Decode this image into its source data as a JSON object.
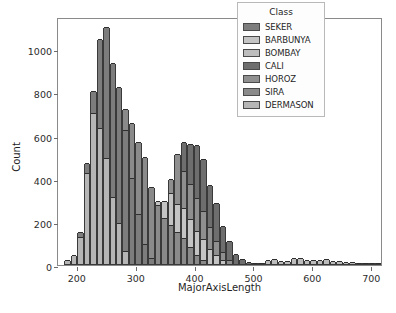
{
  "chart_data": {
    "type": "bar",
    "subtype": "stacked-histogram",
    "title": "",
    "xlabel": "MajorAxisLength",
    "ylabel": "Count",
    "xlim": [
      168,
      720
    ],
    "ylim": [
      0,
      1150
    ],
    "xticks": [
      200,
      300,
      400,
      500,
      600,
      700
    ],
    "yticks": [
      0,
      200,
      400,
      600,
      800,
      1000
    ],
    "grid": false,
    "legend": {
      "title": "Class",
      "position": "upper right",
      "entries": [
        "SEKER",
        "BARBUNYA",
        "BOMBAY",
        "CALI",
        "HOROZ",
        "SIRA",
        "DERMASON"
      ]
    },
    "series": [
      {
        "name": "SEKER",
        "color": "#7d7d7d"
      },
      {
        "name": "BARBUNYA",
        "color": "#c4c4c4"
      },
      {
        "name": "BOMBAY",
        "color": "#bdbdbd"
      },
      {
        "name": "CALI",
        "color": "#6e6e6e"
      },
      {
        "name": "HOROZ",
        "color": "#8f8f8f"
      },
      {
        "name": "SIRA",
        "color": "#8a8a8a"
      },
      {
        "name": "DERMASON",
        "color": "#b6b6b6"
      }
    ],
    "bin_width": 11,
    "bins": [
      {
        "x": 184,
        "total": 18,
        "stack": [
          {
            "s": "DERMASON",
            "v": 18
          }
        ]
      },
      {
        "x": 195,
        "total": 42,
        "stack": [
          {
            "s": "DERMASON",
            "v": 42
          }
        ]
      },
      {
        "x": 206,
        "total": 148,
        "stack": [
          {
            "s": "DERMASON",
            "v": 125
          },
          {
            "s": "SEKER",
            "v": 23
          }
        ]
      },
      {
        "x": 217,
        "total": 468,
        "stack": [
          {
            "s": "DERMASON",
            "v": 420
          },
          {
            "s": "SEKER",
            "v": 48
          }
        ]
      },
      {
        "x": 228,
        "total": 800,
        "stack": [
          {
            "s": "DERMASON",
            "v": 700
          },
          {
            "s": "SEKER",
            "v": 100
          }
        ]
      },
      {
        "x": 239,
        "total": 1045,
        "stack": [
          {
            "s": "DERMASON",
            "v": 630
          },
          {
            "s": "SEKER",
            "v": 415
          }
        ]
      },
      {
        "x": 250,
        "total": 1100,
        "stack": [
          {
            "s": "DERMASON",
            "v": 490
          },
          {
            "s": "SEKER",
            "v": 610
          }
        ]
      },
      {
        "x": 261,
        "total": 930,
        "stack": [
          {
            "s": "DERMASON",
            "v": 310
          },
          {
            "s": "SEKER",
            "v": 620
          }
        ]
      },
      {
        "x": 272,
        "total": 820,
        "stack": [
          {
            "s": "DERMASON",
            "v": 190
          },
          {
            "s": "SEKER",
            "v": 630
          }
        ]
      },
      {
        "x": 283,
        "total": 718,
        "stack": [
          {
            "s": "DERMASON",
            "v": 62
          },
          {
            "s": "SEKER",
            "v": 560
          },
          {
            "s": "SIRA",
            "v": 96
          }
        ]
      },
      {
        "x": 294,
        "total": 652,
        "stack": [
          {
            "s": "SEKER",
            "v": 400
          },
          {
            "s": "SIRA",
            "v": 252
          }
        ]
      },
      {
        "x": 305,
        "total": 565,
        "stack": [
          {
            "s": "SEKER",
            "v": 230
          },
          {
            "s": "SIRA",
            "v": 335
          }
        ]
      },
      {
        "x": 316,
        "total": 498,
        "stack": [
          {
            "s": "SEKER",
            "v": 92
          },
          {
            "s": "SIRA",
            "v": 406
          }
        ]
      },
      {
        "x": 327,
        "total": 355,
        "stack": [
          {
            "s": "SEKER",
            "v": 30
          },
          {
            "s": "SIRA",
            "v": 325
          }
        ]
      },
      {
        "x": 338,
        "total": 292,
        "stack": [
          {
            "s": "SIRA",
            "v": 272
          },
          {
            "s": "BARBUNYA",
            "v": 20
          }
        ]
      },
      {
        "x": 349,
        "total": 292,
        "stack": [
          {
            "s": "SIRA",
            "v": 215
          },
          {
            "s": "BARBUNYA",
            "v": 77
          }
        ]
      },
      {
        "x": 360,
        "total": 392,
        "stack": [
          {
            "s": "SIRA",
            "v": 180
          },
          {
            "s": "BARBUNYA",
            "v": 150
          },
          {
            "s": "HOROZ",
            "v": 62
          }
        ]
      },
      {
        "x": 371,
        "total": 512,
        "stack": [
          {
            "s": "SIRA",
            "v": 150
          },
          {
            "s": "BARBUNYA",
            "v": 130
          },
          {
            "s": "HOROZ",
            "v": 232
          }
        ]
      },
      {
        "x": 382,
        "total": 565,
        "stack": [
          {
            "s": "SIRA",
            "v": 120
          },
          {
            "s": "BARBUNYA",
            "v": 140
          },
          {
            "s": "HOROZ",
            "v": 170
          },
          {
            "s": "CALI",
            "v": 135
          }
        ]
      },
      {
        "x": 393,
        "total": 555,
        "stack": [
          {
            "s": "SIRA",
            "v": 78
          },
          {
            "s": "BARBUNYA",
            "v": 130
          },
          {
            "s": "HOROZ",
            "v": 165
          },
          {
            "s": "CALI",
            "v": 182
          }
        ]
      },
      {
        "x": 404,
        "total": 550,
        "stack": [
          {
            "s": "SIRA",
            "v": 40
          },
          {
            "s": "BARBUNYA",
            "v": 115
          },
          {
            "s": "HOROZ",
            "v": 150
          },
          {
            "s": "CALI",
            "v": 245
          }
        ]
      },
      {
        "x": 415,
        "total": 488,
        "stack": [
          {
            "s": "SIRA",
            "v": 18
          },
          {
            "s": "BARBUNYA",
            "v": 100
          },
          {
            "s": "HOROZ",
            "v": 130
          },
          {
            "s": "CALI",
            "v": 240
          }
        ]
      },
      {
        "x": 426,
        "total": 368,
        "stack": [
          {
            "s": "BARBUNYA",
            "v": 70
          },
          {
            "s": "HOROZ",
            "v": 100
          },
          {
            "s": "CALI",
            "v": 198
          }
        ]
      },
      {
        "x": 437,
        "total": 285,
        "stack": [
          {
            "s": "BARBUNYA",
            "v": 40
          },
          {
            "s": "HOROZ",
            "v": 65
          },
          {
            "s": "CALI",
            "v": 180
          }
        ]
      },
      {
        "x": 448,
        "total": 178,
        "stack": [
          {
            "s": "BARBUNYA",
            "v": 20
          },
          {
            "s": "HOROZ",
            "v": 35
          },
          {
            "s": "CALI",
            "v": 123
          }
        ]
      },
      {
        "x": 459,
        "total": 108,
        "stack": [
          {
            "s": "HOROZ",
            "v": 18
          },
          {
            "s": "CALI",
            "v": 90
          }
        ]
      },
      {
        "x": 470,
        "total": 48,
        "stack": [
          {
            "s": "CALI",
            "v": 48
          }
        ]
      },
      {
        "x": 481,
        "total": 22,
        "stack": [
          {
            "s": "CALI",
            "v": 22
          }
        ]
      },
      {
        "x": 492,
        "total": 10,
        "stack": [
          {
            "s": "CALI",
            "v": 10
          }
        ]
      },
      {
        "x": 503,
        "total": 5,
        "stack": [
          {
            "s": "CALI",
            "v": 5
          }
        ]
      },
      {
        "x": 514,
        "total": 6,
        "stack": [
          {
            "s": "BOMBAY",
            "v": 6
          }
        ]
      },
      {
        "x": 525,
        "total": 18,
        "stack": [
          {
            "s": "BOMBAY",
            "v": 18
          }
        ]
      },
      {
        "x": 536,
        "total": 24,
        "stack": [
          {
            "s": "BOMBAY",
            "v": 24
          }
        ]
      },
      {
        "x": 547,
        "total": 14,
        "stack": [
          {
            "s": "BOMBAY",
            "v": 14
          }
        ]
      },
      {
        "x": 558,
        "total": 12,
        "stack": [
          {
            "s": "BOMBAY",
            "v": 12
          }
        ]
      },
      {
        "x": 569,
        "total": 28,
        "stack": [
          {
            "s": "BOMBAY",
            "v": 28
          }
        ]
      },
      {
        "x": 580,
        "total": 30,
        "stack": [
          {
            "s": "BOMBAY",
            "v": 30
          }
        ]
      },
      {
        "x": 591,
        "total": 20,
        "stack": [
          {
            "s": "BOMBAY",
            "v": 20
          }
        ]
      },
      {
        "x": 602,
        "total": 18,
        "stack": [
          {
            "s": "BOMBAY",
            "v": 18
          }
        ]
      },
      {
        "x": 613,
        "total": 20,
        "stack": [
          {
            "s": "BOMBAY",
            "v": 20
          }
        ]
      },
      {
        "x": 624,
        "total": 24,
        "stack": [
          {
            "s": "BOMBAY",
            "v": 24
          }
        ]
      },
      {
        "x": 635,
        "total": 16,
        "stack": [
          {
            "s": "BOMBAY",
            "v": 16
          }
        ]
      },
      {
        "x": 646,
        "total": 14,
        "stack": [
          {
            "s": "BOMBAY",
            "v": 14
          }
        ]
      },
      {
        "x": 657,
        "total": 10,
        "stack": [
          {
            "s": "BOMBAY",
            "v": 10
          }
        ]
      },
      {
        "x": 668,
        "total": 8,
        "stack": [
          {
            "s": "BOMBAY",
            "v": 8
          }
        ]
      },
      {
        "x": 679,
        "total": 5,
        "stack": [
          {
            "s": "BOMBAY",
            "v": 5
          }
        ]
      },
      {
        "x": 690,
        "total": 3,
        "stack": [
          {
            "s": "BOMBAY",
            "v": 3
          }
        ]
      },
      {
        "x": 701,
        "total": 2,
        "stack": [
          {
            "s": "BOMBAY",
            "v": 2
          }
        ]
      },
      {
        "x": 712,
        "total": 2,
        "stack": [
          {
            "s": "BOMBAY",
            "v": 2
          }
        ]
      }
    ]
  }
}
